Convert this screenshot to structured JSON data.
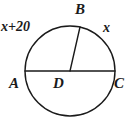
{
  "figure": {
    "kind": "circle-geometry-diagram",
    "width": 129,
    "height": 127,
    "background_color": "#ffffff",
    "stroke_color": "#1a1a1a",
    "text_color": "#1a1a1a"
  },
  "circle": {
    "center_x": 70,
    "center_y": 71,
    "radius": 45,
    "stroke_width": 1.4
  },
  "segments": {
    "diameter": {
      "name": "AC",
      "x1": 25,
      "y1": 71,
      "x2": 115,
      "y2": 71
    },
    "radius": {
      "name": "DB",
      "x1": 70,
      "y1": 71,
      "x2": 80,
      "y2": 27
    }
  },
  "labels": {
    "arc_left": "x+20",
    "arc_right": "x",
    "point_b": "B",
    "point_a": "A",
    "point_d": "D",
    "point_c": "C"
  }
}
